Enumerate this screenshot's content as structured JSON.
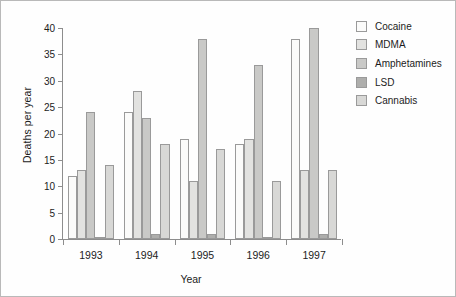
{
  "chart_data": {
    "type": "bar",
    "title": "",
    "xlabel": "Year",
    "ylabel": "Deaths per year",
    "categories": [
      "1993",
      "1994",
      "1995",
      "1996",
      "1997"
    ],
    "yticks": [
      0,
      5,
      10,
      15,
      20,
      25,
      30,
      35,
      40
    ],
    "ylim": [
      0,
      40
    ],
    "grid": false,
    "legend_position": "top-right",
    "series": [
      {
        "name": "Cocaine",
        "color": "#fbfbfa",
        "values": [
          12,
          24,
          19,
          18,
          38
        ]
      },
      {
        "name": "MDMA",
        "color": "#e2e2e0",
        "values": [
          13,
          28,
          11,
          19,
          13
        ]
      },
      {
        "name": "Amphetamines",
        "color": "#c9c9c7",
        "values": [
          24,
          23,
          38,
          33,
          40
        ]
      },
      {
        "name": "LSD",
        "color": "#aeaeac",
        "values": [
          0,
          1,
          1,
          0,
          1
        ]
      },
      {
        "name": "Cannabis",
        "color": "#d8d8d6",
        "values": [
          14,
          18,
          17,
          11,
          13
        ]
      }
    ]
  }
}
